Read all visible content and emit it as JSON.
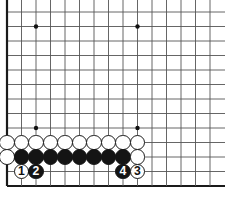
{
  "figure": {
    "kind": "go-board-diagram",
    "board_region": "bottom-left corner",
    "colors": {
      "background": "#ffffff",
      "grid_line": "#555555",
      "border_line": "#1a1a1a",
      "black_stone": "#141414",
      "white_stone": "#ffffff",
      "star_point": "#111111"
    }
  },
  "board": {
    "columns": 15,
    "rows": 13,
    "cell_size": 14.5,
    "origin_x": 7,
    "origin_y": 12,
    "edges": {
      "left": "thick",
      "bottom": "thick",
      "top": "open",
      "right": "open"
    },
    "star_points": [
      {
        "col": 3,
        "row": 2
      },
      {
        "col": 10,
        "row": 2
      },
      {
        "col": 3,
        "row": 9
      },
      {
        "col": 10,
        "row": 9
      }
    ]
  },
  "stones": [
    {
      "col": 1,
      "row": 10,
      "color": "white",
      "label": ""
    },
    {
      "col": 2,
      "row": 10,
      "color": "white",
      "label": ""
    },
    {
      "col": 3,
      "row": 10,
      "color": "white",
      "label": ""
    },
    {
      "col": 4,
      "row": 10,
      "color": "white",
      "label": ""
    },
    {
      "col": 5,
      "row": 10,
      "color": "white",
      "label": ""
    },
    {
      "col": 6,
      "row": 10,
      "color": "white",
      "label": ""
    },
    {
      "col": 7,
      "row": 10,
      "color": "white",
      "label": ""
    },
    {
      "col": 8,
      "row": 10,
      "color": "white",
      "label": ""
    },
    {
      "col": 9,
      "row": 10,
      "color": "white",
      "label": ""
    },
    {
      "col": 10,
      "row": 10,
      "color": "white",
      "label": ""
    },
    {
      "col": 1,
      "row": 11,
      "color": "white",
      "label": ""
    },
    {
      "col": 2,
      "row": 11,
      "color": "black",
      "label": ""
    },
    {
      "col": 3,
      "row": 11,
      "color": "black",
      "label": ""
    },
    {
      "col": 4,
      "row": 11,
      "color": "black",
      "label": ""
    },
    {
      "col": 5,
      "row": 11,
      "color": "black",
      "label": ""
    },
    {
      "col": 6,
      "row": 11,
      "color": "black",
      "label": ""
    },
    {
      "col": 7,
      "row": 11,
      "color": "black",
      "label": ""
    },
    {
      "col": 8,
      "row": 11,
      "color": "black",
      "label": ""
    },
    {
      "col": 9,
      "row": 11,
      "color": "black",
      "label": ""
    },
    {
      "col": 10,
      "row": 11,
      "color": "white",
      "label": ""
    },
    {
      "col": 2,
      "row": 12,
      "color": "white",
      "label": "1"
    },
    {
      "col": 3,
      "row": 12,
      "color": "black",
      "label": "2"
    },
    {
      "col": 9,
      "row": 12,
      "color": "black",
      "label": "4"
    },
    {
      "col": 10,
      "row": 12,
      "color": "white",
      "label": "3"
    }
  ],
  "move_sequence": [
    {
      "number": "1",
      "color": "white"
    },
    {
      "number": "2",
      "color": "black"
    },
    {
      "number": "3",
      "color": "white"
    },
    {
      "number": "4",
      "color": "black"
    }
  ]
}
